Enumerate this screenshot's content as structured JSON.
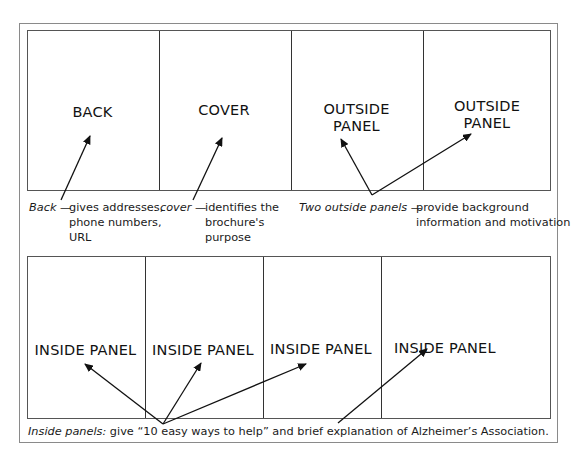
{
  "top_row": {
    "panels": [
      {
        "label": "BACK"
      },
      {
        "label": "COVER"
      },
      {
        "label_line1": "OUTSIDE",
        "label_line2": "PANEL"
      },
      {
        "label_line1": "OUTSIDE",
        "label_line2": "PANEL"
      }
    ],
    "captions": {
      "back": {
        "term": "Back",
        "dash": " — ",
        "line1": "gives addresses,",
        "line2": "phone numbers,",
        "line3": "URL"
      },
      "cover": {
        "term": "cover",
        "dash": " — ",
        "line1": "identifies the",
        "line2": "brochure's",
        "line3": "purpose"
      },
      "outside": {
        "term": "Two outside panels",
        "dash": " — ",
        "line1": "provide background",
        "line2": "information and motivation"
      }
    }
  },
  "bottom_row": {
    "panels": [
      {
        "label": "INSIDE PANEL"
      },
      {
        "label": "INSIDE PANEL"
      },
      {
        "label": "INSIDE PANEL"
      },
      {
        "label": "INSIDE PANEL"
      }
    ],
    "caption": {
      "term": "Inside panels:",
      "text": " give “10 easy ways to help” and brief explanation of Alzheimer’s Association."
    }
  }
}
